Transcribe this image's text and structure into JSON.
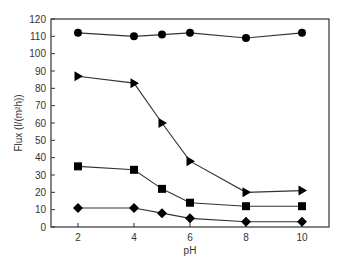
{
  "chart_data": {
    "type": "line",
    "title": "",
    "xlabel": "pH",
    "ylabel": "Flux (l/(m²h))",
    "xlim": [
      1.3,
      11
    ],
    "ylim": [
      0,
      120
    ],
    "x_ticks": [
      2,
      4,
      6,
      8,
      10
    ],
    "y_ticks": [
      0,
      10,
      20,
      30,
      40,
      50,
      60,
      70,
      80,
      90,
      100,
      110,
      120
    ],
    "grid": false,
    "legend": null,
    "x": [
      2,
      4,
      5,
      6,
      8,
      10
    ],
    "series": [
      {
        "name": "circle",
        "marker": "circle",
        "values": [
          112,
          110,
          111,
          112,
          109,
          112
        ]
      },
      {
        "name": "triangle",
        "marker": "triangle-right",
        "values": [
          87,
          83,
          60,
          38,
          20,
          21
        ]
      },
      {
        "name": "square",
        "marker": "square",
        "values": [
          35,
          33,
          22,
          14,
          12,
          12
        ]
      },
      {
        "name": "diamond",
        "marker": "diamond",
        "values": [
          11,
          11,
          8,
          5,
          3,
          3
        ]
      }
    ]
  },
  "labels": {
    "xlabel": "pH",
    "ylabel": "Flux (l/(m²h))"
  }
}
